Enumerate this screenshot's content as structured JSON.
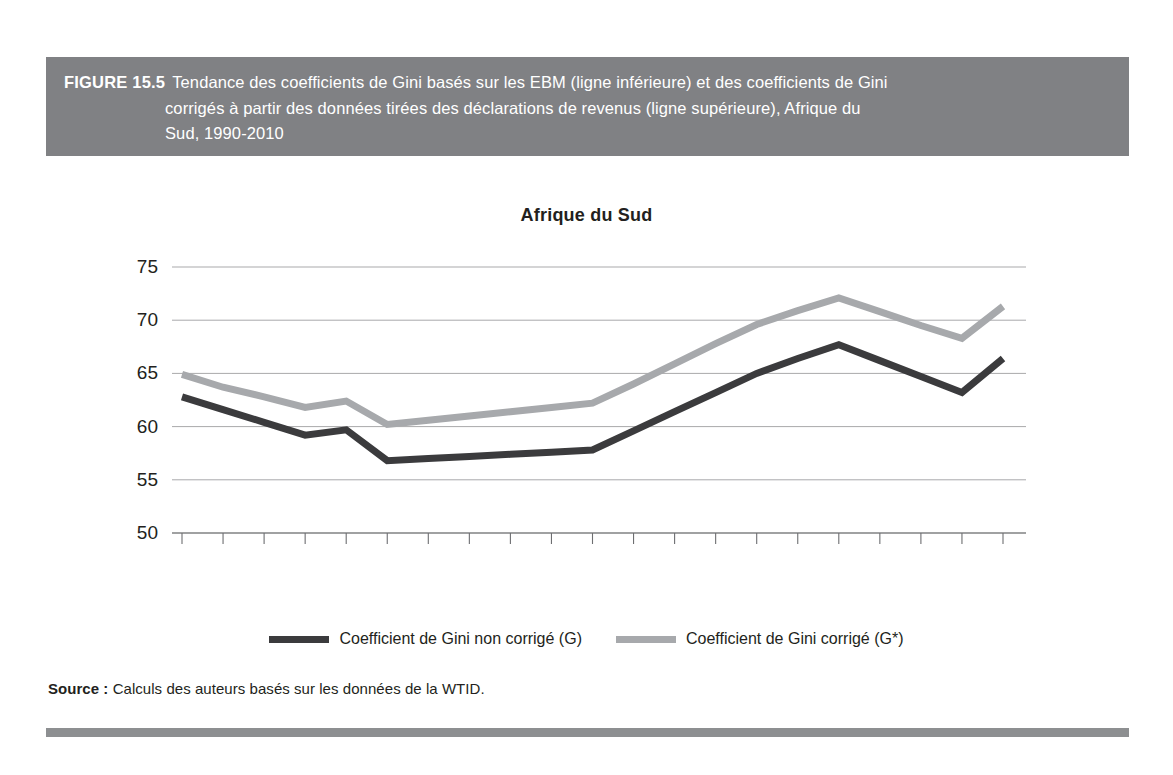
{
  "figure": {
    "label": "FIGURE 15.5",
    "caption_line1": "Tendance des coefficients de Gini basés sur les EBM (ligne inférieure) et des coefficients de Gini",
    "caption_line2": "corrigés à partir des données tirées des déclarations de revenus (ligne supérieure), Afrique du",
    "caption_line3": "Sud, 1990-2010",
    "band_color": "#808184",
    "rule_color": "#8d8f91"
  },
  "source": {
    "label": "Source :",
    "text": "Calculs des auteurs basés sur les données de la WTID."
  },
  "legend": {
    "position": "bottom-center",
    "items": [
      {
        "label": "Coefficient de Gini non corrigé (G)",
        "color": "#3b3b3d"
      },
      {
        "label": "Coefficient de Gini corrigé (G*)",
        "color": "#a7a9ac"
      }
    ]
  },
  "chart_data": {
    "type": "line",
    "title": "Afrique du Sud",
    "xlabel": "",
    "ylabel": "",
    "grid": true,
    "xlim": [
      1990,
      2010
    ],
    "ylim": [
      50,
      75
    ],
    "yticks": [
      50,
      55,
      60,
      65,
      70,
      75
    ],
    "ytick_labels": [
      "50",
      "55",
      "60",
      "65",
      "70",
      "75"
    ],
    "x": [
      1990,
      1991,
      1992,
      1993,
      1994,
      1995,
      1996,
      1997,
      1998,
      1999,
      2000,
      2001,
      2002,
      2003,
      2004,
      2005,
      2006,
      2007,
      2008,
      2009,
      2010
    ],
    "xtick_labels": [
      "1990",
      "1991",
      "1992",
      "1993",
      "1994",
      "1995",
      "1996",
      "1997",
      "1998",
      "1999",
      "2000",
      "2001",
      "2002",
      "2003",
      "2004",
      "2005",
      "2006",
      "2007",
      "2008",
      "2009",
      "2010"
    ],
    "series": [
      {
        "name": "Coefficient de Gini non corrigé (G)",
        "color": "#3b3b3d",
        "width": 7,
        "values": [
          62.8,
          61.6,
          60.4,
          59.2,
          59.7,
          56.8,
          57.0,
          57.2,
          57.4,
          57.6,
          57.8,
          59.6,
          61.4,
          63.2,
          65.0,
          66.4,
          67.7,
          66.2,
          64.7,
          63.2,
          66.4
        ]
      },
      {
        "name": "Coefficient de Gini corrigé (G*)",
        "color": "#a7a9ac",
        "width": 7,
        "values": [
          64.9,
          63.7,
          62.8,
          61.8,
          62.4,
          60.2,
          60.6,
          61.0,
          61.4,
          61.8,
          62.2,
          64.0,
          65.9,
          67.8,
          69.6,
          70.9,
          72.1,
          70.8,
          69.5,
          68.3,
          71.3
        ]
      }
    ]
  }
}
